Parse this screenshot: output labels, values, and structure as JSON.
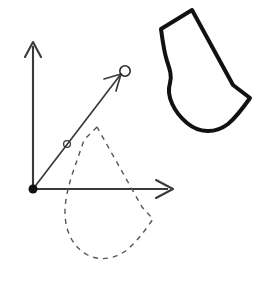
{
  "figure": {
    "background_color": "#ffffff",
    "width": 261,
    "height": 288,
    "stroke_color": "#111111",
    "axis_color": "#3a3a3a",
    "dashed_color": "#555555"
  },
  "chart_data": {
    "type": "diagram",
    "xlabel": "",
    "ylabel": "",
    "grid": false,
    "legend": "none",
    "axes": {
      "origin": [
        33,
        189
      ],
      "x_axis": {
        "from": [
          33,
          189
        ],
        "to": [
          172,
          189
        ],
        "arrow": true,
        "label": ""
      },
      "y_axis": {
        "from": [
          33,
          189
        ],
        "to": [
          33,
          42
        ],
        "arrow": true,
        "label": ""
      },
      "origin_marker": {
        "shape": "filled-circle",
        "radius": 4.5,
        "color": "#111111"
      }
    },
    "rotation_ray": {
      "from": [
        33,
        189
      ],
      "to": [
        122,
        73
      ],
      "arrow": true,
      "angle_marker": {
        "at": [
          67,
          144
        ],
        "shape": "open-circle",
        "radius": 3.4
      },
      "end_marker": {
        "at": [
          125,
          71
        ],
        "shape": "open-circle",
        "radius": 5.2
      }
    },
    "shapes": [
      {
        "name": "sock-outline-solid",
        "style": "solid",
        "stroke_width": 4,
        "stroke": "#111111",
        "fill": "none",
        "description": "thick solid sock / boot outline, upper right, rotated",
        "path": "M 192 10 L 161 29 C 163 44 164 52 167 61 C 170 70 172 76 170 83 C 166 96 174 112 187 123 C 199 133 215 134 228 124 C 234 119 243 108 250 98 L 233 85 L 192 10 Z"
      },
      {
        "name": "sock-outline-dashed",
        "style": "dashed",
        "stroke_width": 1.4,
        "stroke": "#555555",
        "fill": "none",
        "dash_pattern": "5 5",
        "description": "dashed sock / boot outline in original (pre-rotation) position, lower area crossing the x-axis",
        "path": "M 97 127 L 84 140 C 80 152 76 163 72 175 C 68 188 65 200 65 212 C 65 230 72 246 86 254 C 99 262 116 259 128 249 C 136 242 145 231 153 219 L 142 207 L 97 127 Z"
      }
    ],
    "annotations": []
  }
}
